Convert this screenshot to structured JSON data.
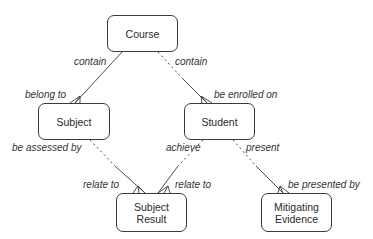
{
  "entities": {
    "course": {
      "name": "Course"
    },
    "subject": {
      "name": "Subject"
    },
    "student": {
      "name": "Student"
    },
    "subject_result": {
      "line1": "Subject",
      "line2": "Result"
    },
    "mitigating_evidence": {
      "line1": "Mitigating",
      "line2": "Evidence"
    }
  },
  "relationships": [
    {
      "from": "Course",
      "to": "Subject",
      "from_label": "contain",
      "to_label": "belong to",
      "from_optional": false,
      "to_many": true
    },
    {
      "from": "Course",
      "to": "Student",
      "from_label": "contain",
      "to_label": "be enrolled on",
      "from_optional": true,
      "to_many": true
    },
    {
      "from": "Subject",
      "to": "Subject Result",
      "from_label": "be assessed by",
      "to_label": "relate to",
      "from_optional": true,
      "to_many": true
    },
    {
      "from": "Student",
      "to": "Subject Result",
      "from_label": "achieve",
      "to_label": "relate to",
      "from_optional": true,
      "to_many": true
    },
    {
      "from": "Student",
      "to": "Mitigating Evidence",
      "from_label": "present",
      "to_label": "be presented by",
      "from_optional": true,
      "to_many": true
    }
  ],
  "labels": {
    "course_contain_left": "contain",
    "course_contain_right": "contain",
    "belong_to": "belong to",
    "be_enrolled_on": "be enrolled on",
    "be_assessed_by": "be assessed by",
    "achieve": "achieve",
    "present": "present",
    "relate_to_left": "relate to",
    "relate_to_right": "relate to",
    "be_presented_by": "be presented by"
  },
  "colors": {
    "line": "#3a3a3a",
    "text": "#2a2a2a"
  }
}
